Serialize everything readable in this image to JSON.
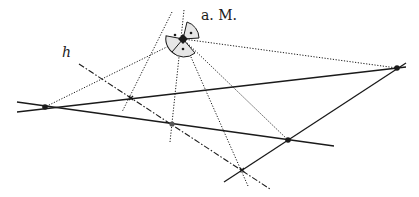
{
  "figure": {
    "labels": {
      "observer": "a. M.",
      "horizon": "h"
    },
    "colors": {
      "stroke": "#1a1a1a",
      "eye_fill": "#e6e6e6",
      "background": "#ffffff"
    },
    "observer_point": [
      183,
      39
    ],
    "points": {
      "left": [
        45,
        107
      ],
      "right": [
        397,
        68
      ],
      "lower_right": [
        288,
        140
      ],
      "horizon_cross_1": [
        131,
        98
      ],
      "horizon_cross_2": [
        172,
        124
      ],
      "horizon_cross_3": [
        242,
        170
      ]
    },
    "legend_styles": {
      "solid": "lines of the figure",
      "dotted": "sight rays from eye point",
      "dash_dot": "horizon line h"
    }
  }
}
